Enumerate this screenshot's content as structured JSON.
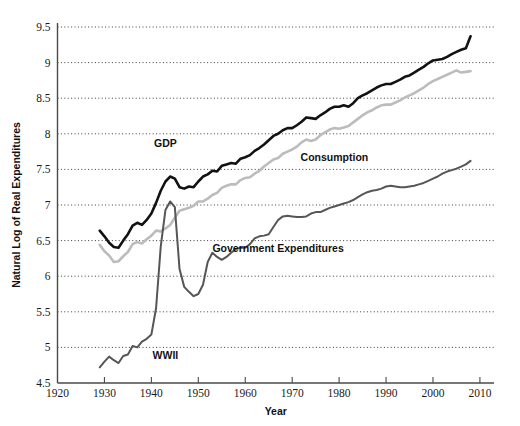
{
  "chart_data": {
    "type": "line",
    "title": "",
    "xlabel": "Year",
    "ylabel": "Natural Log of Real Expenditures",
    "xlim": [
      1920,
      2013
    ],
    "ylim": [
      4.5,
      9.5
    ],
    "grid": true,
    "legend_position": "inline-annotations",
    "xticks": [
      1920,
      1930,
      1940,
      1950,
      1960,
      1970,
      1980,
      1990,
      2000,
      2010
    ],
    "yticks": [
      4.5,
      5,
      5.5,
      6,
      6.5,
      7,
      7.5,
      8,
      8.5,
      9,
      9.5
    ],
    "annotations": [
      {
        "text": "GDP",
        "x": 1943,
        "y": 7.82
      },
      {
        "text": "Consumption",
        "x": 1979,
        "y": 7.62
      },
      {
        "text": "Government Expenditures",
        "x": 1967,
        "y": 6.34
      },
      {
        "text": "WWII",
        "x": 1943,
        "y": 4.84
      }
    ],
    "series": [
      {
        "name": "GDP",
        "color": "#121212",
        "width": 2.6,
        "x": [
          1929,
          1930,
          1931,
          1932,
          1933,
          1934,
          1935,
          1936,
          1937,
          1938,
          1939,
          1940,
          1941,
          1942,
          1943,
          1944,
          1945,
          1946,
          1947,
          1948,
          1949,
          1950,
          1951,
          1952,
          1953,
          1954,
          1955,
          1956,
          1957,
          1958,
          1959,
          1960,
          1961,
          1962,
          1963,
          1964,
          1965,
          1966,
          1967,
          1968,
          1969,
          1970,
          1971,
          1972,
          1973,
          1974,
          1975,
          1976,
          1977,
          1978,
          1979,
          1980,
          1981,
          1982,
          1983,
          1984,
          1985,
          1986,
          1987,
          1988,
          1989,
          1990,
          1991,
          1992,
          1993,
          1994,
          1995,
          1996,
          1997,
          1998,
          1999,
          2000,
          2001,
          2002,
          2003,
          2004,
          2005,
          2006,
          2007,
          2008
        ],
        "y": [
          6.64,
          6.56,
          6.47,
          6.41,
          6.4,
          6.5,
          6.59,
          6.71,
          6.75,
          6.72,
          6.79,
          6.88,
          7.03,
          7.2,
          7.33,
          7.4,
          7.37,
          7.25,
          7.23,
          7.26,
          7.25,
          7.33,
          7.4,
          7.43,
          7.48,
          7.47,
          7.55,
          7.57,
          7.59,
          7.58,
          7.65,
          7.67,
          7.7,
          7.76,
          7.8,
          7.85,
          7.91,
          7.97,
          8.0,
          8.05,
          8.08,
          8.08,
          8.12,
          8.17,
          8.23,
          8.22,
          8.21,
          8.26,
          8.3,
          8.35,
          8.38,
          8.38,
          8.4,
          8.38,
          8.43,
          8.5,
          8.54,
          8.57,
          8.61,
          8.65,
          8.68,
          8.7,
          8.7,
          8.73,
          8.76,
          8.8,
          8.82,
          8.86,
          8.9,
          8.94,
          8.99,
          9.03,
          9.04,
          9.05,
          9.08,
          9.12,
          9.15,
          9.18,
          9.2,
          9.37
        ]
      },
      {
        "name": "Consumption",
        "color": "#bcbcbc",
        "width": 2.6,
        "x": [
          1929,
          1930,
          1931,
          1932,
          1933,
          1934,
          1935,
          1936,
          1937,
          1938,
          1939,
          1940,
          1941,
          1942,
          1943,
          1944,
          1945,
          1946,
          1947,
          1948,
          1949,
          1950,
          1951,
          1952,
          1953,
          1954,
          1955,
          1956,
          1957,
          1958,
          1959,
          1960,
          1961,
          1962,
          1963,
          1964,
          1965,
          1966,
          1967,
          1968,
          1969,
          1970,
          1971,
          1972,
          1973,
          1974,
          1975,
          1976,
          1977,
          1978,
          1979,
          1980,
          1981,
          1982,
          1983,
          1984,
          1985,
          1986,
          1987,
          1988,
          1989,
          1990,
          1991,
          1992,
          1993,
          1994,
          1995,
          1996,
          1997,
          1998,
          1999,
          2000,
          2001,
          2002,
          2003,
          2004,
          2005,
          2006,
          2007,
          2008
        ],
        "y": [
          6.44,
          6.35,
          6.29,
          6.2,
          6.21,
          6.28,
          6.34,
          6.45,
          6.48,
          6.46,
          6.52,
          6.57,
          6.64,
          6.63,
          6.67,
          6.72,
          6.82,
          6.92,
          6.94,
          6.96,
          6.99,
          7.05,
          7.05,
          7.09,
          7.14,
          7.17,
          7.24,
          7.27,
          7.29,
          7.29,
          7.35,
          7.38,
          7.39,
          7.44,
          7.48,
          7.54,
          7.59,
          7.64,
          7.66,
          7.72,
          7.75,
          7.78,
          7.82,
          7.88,
          7.92,
          7.9,
          7.92,
          7.98,
          8.02,
          8.06,
          8.08,
          8.07,
          8.09,
          8.11,
          8.16,
          8.21,
          8.26,
          8.3,
          8.33,
          8.37,
          8.4,
          8.41,
          8.41,
          8.44,
          8.47,
          8.51,
          8.54,
          8.57,
          8.61,
          8.65,
          8.7,
          8.74,
          8.77,
          8.8,
          8.83,
          8.86,
          8.89,
          8.86,
          8.87,
          8.88
        ]
      },
      {
        "name": "Government Expenditures",
        "color": "#565656",
        "width": 2.0,
        "x": [
          1929,
          1930,
          1931,
          1932,
          1933,
          1934,
          1935,
          1936,
          1937,
          1938,
          1939,
          1940,
          1941,
          1942,
          1943,
          1944,
          1945,
          1946,
          1947,
          1948,
          1949,
          1950,
          1951,
          1952,
          1953,
          1954,
          1955,
          1956,
          1957,
          1958,
          1959,
          1960,
          1961,
          1962,
          1963,
          1964,
          1965,
          1966,
          1967,
          1968,
          1969,
          1970,
          1971,
          1972,
          1973,
          1974,
          1975,
          1976,
          1977,
          1978,
          1979,
          1980,
          1981,
          1982,
          1983,
          1984,
          1985,
          1986,
          1987,
          1988,
          1989,
          1990,
          1991,
          1992,
          1993,
          1994,
          1995,
          1996,
          1997,
          1998,
          1999,
          2000,
          2001,
          2002,
          2003,
          2004,
          2005,
          2006,
          2007,
          2008
        ],
        "y": [
          4.72,
          4.8,
          4.87,
          4.82,
          4.78,
          4.88,
          4.9,
          5.02,
          5.0,
          5.08,
          5.12,
          5.18,
          5.55,
          6.42,
          6.93,
          7.05,
          6.97,
          6.1,
          5.85,
          5.78,
          5.72,
          5.75,
          5.88,
          6.2,
          6.33,
          6.27,
          6.23,
          6.27,
          6.33,
          6.38,
          6.4,
          6.4,
          6.45,
          6.53,
          6.56,
          6.57,
          6.59,
          6.69,
          6.79,
          6.84,
          6.85,
          6.84,
          6.83,
          6.83,
          6.84,
          6.88,
          6.9,
          6.9,
          6.93,
          6.96,
          6.98,
          7.0,
          7.02,
          7.04,
          7.07,
          7.11,
          7.15,
          7.18,
          7.2,
          7.21,
          7.23,
          7.26,
          7.27,
          7.26,
          7.25,
          7.25,
          7.26,
          7.27,
          7.29,
          7.31,
          7.34,
          7.37,
          7.4,
          7.44,
          7.47,
          7.49,
          7.51,
          7.54,
          7.57,
          7.62
        ]
      }
    ]
  }
}
